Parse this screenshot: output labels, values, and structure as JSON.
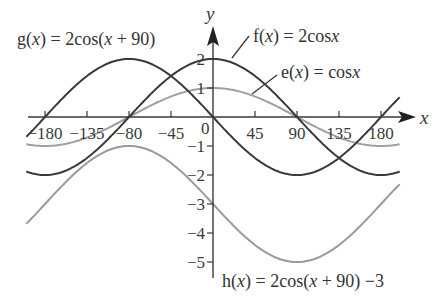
{
  "chart_data": {
    "type": "line",
    "title": "",
    "xlabel": "x",
    "ylabel": "y",
    "xlim": [
      -200,
      200
    ],
    "ylim": [
      -5.3,
      2.6
    ],
    "grid": false,
    "x_ticks": [
      -180,
      -135,
      -90,
      -45,
      45,
      90,
      135,
      180
    ],
    "x_tick_labels": [
      "−180",
      "−135",
      "−80",
      "−45",
      "45",
      "90",
      "135",
      "180"
    ],
    "y_ticks": [
      2,
      1,
      -1,
      -2,
      -3,
      -4,
      -5
    ],
    "y_tick_labels": [
      "2",
      "1",
      "−1",
      "−2",
      "−3",
      "−4",
      "−5"
    ],
    "origin_label": "0",
    "series": [
      {
        "name": "f(x) = 2cosx",
        "expr": "2cos(x)",
        "amplitude": 2,
        "phase": 0,
        "shift": 0,
        "color": "#3a3a3a",
        "x": [
          -200,
          -180,
          -135,
          -90,
          -45,
          0,
          45,
          90,
          135,
          180,
          200
        ],
        "values": [
          -1.88,
          -2,
          -1.41,
          0,
          1.41,
          2,
          1.41,
          0,
          -1.41,
          -2,
          -1.88
        ]
      },
      {
        "name": "e(x) = cosx",
        "expr": "cos(x)",
        "amplitude": 1,
        "phase": 0,
        "shift": 0,
        "color": "#a0a0a0",
        "x": [
          -200,
          -180,
          -135,
          -90,
          -45,
          0,
          45,
          90,
          135,
          180,
          200
        ],
        "values": [
          -0.94,
          -1,
          -0.71,
          0,
          0.71,
          1,
          0.71,
          0,
          -0.71,
          -1,
          -0.94
        ]
      },
      {
        "name": "g(x) = 2cos(x + 90)",
        "expr": "2cos(x+90)",
        "amplitude": 2,
        "phase": 90,
        "shift": 0,
        "color": "#3a3a3a",
        "x": [
          -200,
          -180,
          -135,
          -90,
          -45,
          0,
          45,
          90,
          135,
          180,
          200
        ],
        "values": [
          0.68,
          0,
          1.41,
          2,
          1.41,
          0,
          -1.41,
          -2,
          -1.41,
          0,
          0.68
        ]
      },
      {
        "name": "h(x) = 2cos(x + 90) −3",
        "expr": "2cos(x+90)-3",
        "amplitude": 2,
        "phase": 90,
        "shift": -3,
        "color": "#9a9a9a",
        "x": [
          -200,
          -180,
          -135,
          -90,
          -45,
          0,
          45,
          90,
          135,
          180,
          200
        ],
        "values": [
          -2.32,
          -3,
          -1.59,
          -1,
          -1.59,
          -3,
          -4.41,
          -5,
          -4.41,
          -3,
          -2.32
        ]
      }
    ],
    "annotations": [
      {
        "text_parts": [
          "g(",
          "x",
          ") = 2cos(",
          "x",
          " + 90)"
        ],
        "target": "g"
      },
      {
        "text_parts": [
          "f(",
          "x",
          ") = 2cos",
          "x"
        ],
        "target": "f"
      },
      {
        "text_parts": [
          "e(",
          "x",
          ") = cos",
          "x"
        ],
        "target": "e"
      },
      {
        "text_parts": [
          "h(",
          "x",
          ") = 2cos(",
          "x",
          " + 90) −3"
        ],
        "target": "h"
      }
    ]
  },
  "layout": {
    "origin_px": [
      213,
      117
    ],
    "px_per_degree": 0.9333,
    "px_per_unit": 29
  }
}
